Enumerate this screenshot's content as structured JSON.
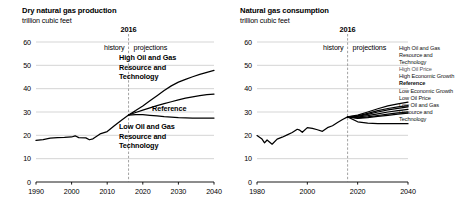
{
  "figure": {
    "width": 462,
    "height": 207,
    "background": "#ffffff",
    "ink": "#000000",
    "gridline_color": "#b9b9b9",
    "divider_color": "#7a7a7a"
  },
  "panels": {
    "left": {
      "title": "Dry natural gas production",
      "subtitle": "trillion cubic feet",
      "divider_label": "2016",
      "history_label": "history",
      "projections_label": "projections",
      "annotations": [
        {
          "name": "high-case-label",
          "lines": [
            "High Oil and Gas",
            "Resource and",
            "Technology"
          ]
        },
        {
          "name": "reference-label",
          "lines": [
            "Reference"
          ]
        },
        {
          "name": "low-case-label",
          "lines": [
            "Low Oil and Gas",
            "Resource and",
            "Technology"
          ]
        }
      ]
    },
    "right": {
      "title": "Natural gas consumption",
      "subtitle": "trillion cubic feet",
      "divider_label": "2016",
      "history_label": "history",
      "projections_label": "projections",
      "legend": [
        {
          "label": "High Oil and Gas Resource and Technology",
          "style": "normal"
        },
        {
          "label": "High Oil Price",
          "style": "dim"
        },
        {
          "label": "High Economic Growth",
          "style": "normal"
        },
        {
          "label": "Reference",
          "style": "bold"
        },
        {
          "label": "Low Economic Growth",
          "style": "normal"
        },
        {
          "label": "Low Oil Price",
          "style": "normal"
        },
        {
          "label": "Low Oil and Gas Resource and Technology",
          "style": "normal"
        }
      ]
    }
  },
  "chart_data": [
    {
      "id": "dry-natural-gas-production",
      "type": "line",
      "title": "Dry natural gas production",
      "subtitle": "trillion cubic feet",
      "xlabel": "",
      "ylabel": "trillion cubic feet",
      "xlim": [
        1990,
        2040
      ],
      "ylim": [
        0,
        60
      ],
      "xticks": [
        1990,
        2000,
        2010,
        2020,
        2030,
        2040
      ],
      "yticks": [
        0,
        10,
        20,
        30,
        40,
        50,
        60
      ],
      "grid": "horizontal",
      "legend_position": "in-plot-annotations",
      "split_year": 2016,
      "split_label": "2016",
      "left_region_label": "history",
      "right_region_label": "projections",
      "series": [
        {
          "name": "History",
          "x": [
            1990,
            1992,
            1994,
            1996,
            1998,
            2000,
            2001,
            2002,
            2004,
            2005,
            2006,
            2008,
            2010,
            2012,
            2014,
            2016
          ],
          "values": [
            17.8,
            18.2,
            18.8,
            19.0,
            19.1,
            19.3,
            19.8,
            19.0,
            18.9,
            18.1,
            18.5,
            20.6,
            21.6,
            24.1,
            26.5,
            28.7
          ]
        },
        {
          "name": "High Oil and Gas Resource and Technology",
          "x": [
            2016,
            2018,
            2020,
            2022,
            2024,
            2026,
            2028,
            2030,
            2032,
            2034,
            2036,
            2038,
            2040
          ],
          "values": [
            28.7,
            30.6,
            32.6,
            34.8,
            37.0,
            39.2,
            41.2,
            42.8,
            44.0,
            45.1,
            46.1,
            47.0,
            47.8
          ]
        },
        {
          "name": "Reference",
          "x": [
            2016,
            2018,
            2020,
            2022,
            2024,
            2026,
            2028,
            2030,
            2032,
            2034,
            2036,
            2038,
            2040
          ],
          "values": [
            28.7,
            29.8,
            30.8,
            31.8,
            32.7,
            33.6,
            34.4,
            35.2,
            35.9,
            36.5,
            37.0,
            37.4,
            37.7
          ]
        },
        {
          "name": "Low Oil and Gas Resource and Technology",
          "x": [
            2016,
            2018,
            2020,
            2022,
            2024,
            2026,
            2028,
            2030,
            2032,
            2034,
            2036,
            2038,
            2040
          ],
          "values": [
            28.7,
            28.9,
            28.9,
            28.6,
            28.3,
            28.0,
            27.8,
            27.6,
            27.5,
            27.4,
            27.4,
            27.4,
            27.4
          ]
        }
      ]
    },
    {
      "id": "natural-gas-consumption",
      "type": "line",
      "title": "Natural gas consumption",
      "subtitle": "trillion cubic feet",
      "xlabel": "",
      "ylabel": "trillion cubic feet",
      "xlim": [
        1980,
        2040
      ],
      "ylim": [
        0,
        60
      ],
      "xticks": [
        1980,
        2000,
        2020,
        2040
      ],
      "yticks": [
        0,
        10,
        20,
        30,
        40,
        50,
        60
      ],
      "grid": "horizontal",
      "legend_position": "right",
      "split_year": 2016,
      "split_label": "2016",
      "left_region_label": "history",
      "right_region_label": "projections",
      "series": [
        {
          "name": "History",
          "x": [
            1980,
            1982,
            1983,
            1984,
            1986,
            1988,
            1990,
            1992,
            1994,
            1996,
            1997,
            1998,
            2000,
            2002,
            2004,
            2006,
            2008,
            2010,
            2012,
            2014,
            2016
          ],
          "values": [
            19.9,
            18.4,
            16.8,
            18.0,
            16.2,
            18.4,
            19.2,
            20.2,
            21.2,
            22.6,
            22.2,
            21.3,
            23.3,
            23.0,
            22.4,
            21.7,
            23.3,
            24.1,
            25.5,
            26.8,
            27.9
          ]
        },
        {
          "name": "High Oil and Gas Resource and Technology",
          "x": [
            2016,
            2020,
            2024,
            2028,
            2032,
            2036,
            2040
          ],
          "values": [
            27.9,
            28.7,
            30.0,
            31.4,
            32.6,
            33.5,
            34.2
          ]
        },
        {
          "name": "High Oil Price",
          "x": [
            2016,
            2020,
            2024,
            2028,
            2032,
            2036,
            2040
          ],
          "values": [
            27.9,
            28.3,
            29.4,
            30.6,
            31.5,
            32.2,
            32.7
          ]
        },
        {
          "name": "High Economic Growth",
          "x": [
            2016,
            2020,
            2024,
            2028,
            2032,
            2036,
            2040
          ],
          "values": [
            27.9,
            28.1,
            29.0,
            30.0,
            30.9,
            31.6,
            32.2
          ]
        },
        {
          "name": "Reference",
          "x": [
            2016,
            2020,
            2024,
            2028,
            2032,
            2036,
            2040
          ],
          "values": [
            27.9,
            27.8,
            28.4,
            29.2,
            30.0,
            30.6,
            31.1
          ]
        },
        {
          "name": "Low Economic Growth",
          "x": [
            2016,
            2020,
            2024,
            2028,
            2032,
            2036,
            2040
          ],
          "values": [
            27.9,
            27.5,
            27.9,
            28.5,
            29.1,
            29.6,
            30.0
          ]
        },
        {
          "name": "Low Oil Price",
          "x": [
            2016,
            2020,
            2024,
            2028,
            2032,
            2036,
            2040
          ],
          "values": [
            27.9,
            27.3,
            27.6,
            28.1,
            28.6,
            29.1,
            29.5
          ]
        },
        {
          "name": "Low Oil and Gas Resource and Technology",
          "x": [
            2016,
            2020,
            2024,
            2028,
            2032,
            2036,
            2040
          ],
          "values": [
            27.9,
            25.8,
            25.2,
            25.0,
            25.0,
            25.0,
            25.0
          ]
        }
      ]
    }
  ]
}
